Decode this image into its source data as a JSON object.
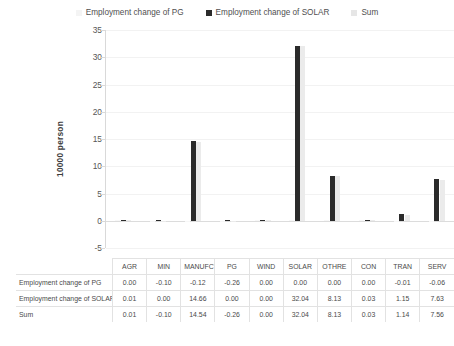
{
  "chart_data": {
    "type": "bar",
    "title": "",
    "xlabel": "",
    "ylabel": "10000 person",
    "ylim": [
      -5,
      35
    ],
    "ytick_step": 5,
    "yticks": [
      "35",
      "30",
      "25",
      "20",
      "15",
      "10",
      "5",
      "0",
      "-5"
    ],
    "grid": true,
    "legend_position": "top-center",
    "categories": [
      "AGR",
      "MIN",
      "MANUFCT",
      "PG",
      "WIND",
      "SOLAR",
      "OTHRE",
      "CON",
      "TRAN",
      "SERV"
    ],
    "series": [
      {
        "name": "Employment change of PG",
        "color": "#f7f7f7",
        "values": [
          0.0,
          -0.1,
          -0.12,
          -0.26,
          0.0,
          0.0,
          0.0,
          0.0,
          -0.01,
          -0.06
        ],
        "labels": [
          "0.00",
          "-0.10",
          "-0.12",
          "-0.26",
          "0.00",
          "0.00",
          "0.00",
          "0.00",
          "-0.01",
          "-0.06"
        ]
      },
      {
        "name": "Employment change of SOLAR",
        "color": "#2b2b2b",
        "values": [
          0.01,
          0.0,
          14.66,
          0.0,
          0.0,
          32.04,
          8.13,
          0.03,
          1.15,
          7.63
        ],
        "labels": [
          "0.01",
          "0.00",
          "14.66",
          "0.00",
          "0.00",
          "32.04",
          "8.13",
          "0.03",
          "1.15",
          "7.63"
        ]
      },
      {
        "name": "Sum",
        "color": "#ebebeb",
        "values": [
          0.01,
          -0.1,
          14.54,
          -0.26,
          0.0,
          32.04,
          8.13,
          0.03,
          1.14,
          7.56
        ],
        "labels": [
          "0.01",
          "-0.10",
          "14.54",
          "-0.26",
          "0.00",
          "32.04",
          "8.13",
          "0.03",
          "1.14",
          "7.56"
        ]
      }
    ]
  },
  "legend": {
    "items": [
      {
        "label": "Employment change of PG",
        "swatch": "#f4f4f4"
      },
      {
        "label": "Employment change of SOLAR",
        "swatch": "#2b2b2b"
      },
      {
        "label": "Sum",
        "swatch": "#e6e6e6"
      }
    ]
  },
  "axis": {
    "ylabel": "10000 person",
    "yticks": [
      "35",
      "30",
      "25",
      "20",
      "15",
      "10",
      "5",
      "0",
      "-5"
    ]
  },
  "table": {
    "corner": "",
    "columns": [
      "AGR",
      "MIN",
      "MANUFCT",
      "PG",
      "WIND",
      "SOLAR",
      "OTHRE",
      "CON",
      "TRAN",
      "SERV"
    ],
    "rows": [
      {
        "label": "Employment change of PG",
        "cells": [
          "0.00",
          "-0.10",
          "-0.12",
          "-0.26",
          "0.00",
          "0.00",
          "0.00",
          "0.00",
          "-0.01",
          "-0.06"
        ]
      },
      {
        "label": "Employment change of SOLAR",
        "cells": [
          "0.01",
          "0.00",
          "14.66",
          "0.00",
          "0.00",
          "32.04",
          "8.13",
          "0.03",
          "1.15",
          "7.63"
        ]
      },
      {
        "label": "Sum",
        "cells": [
          "0.01",
          "-0.10",
          "14.54",
          "-0.26",
          "0.00",
          "32.04",
          "8.13",
          "0.03",
          "1.14",
          "7.56"
        ]
      }
    ]
  }
}
